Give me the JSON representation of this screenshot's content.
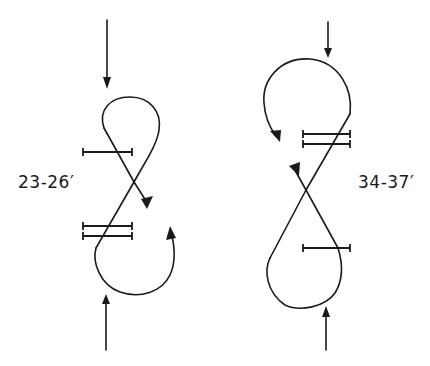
{
  "diagram": {
    "type": "figure-eight-track-diagram",
    "style": "hand-drawn line art, black on white",
    "colors": {
      "line": "#1a1a1a",
      "background": "#ffffff"
    },
    "figures": [
      {
        "id": "left",
        "label": "23-26′",
        "entry_arrow": "top, pointing down",
        "exit_arrow": "bottom, pointing up",
        "loops": [
          "small loop on top",
          "larger open loop at bottom with curving arrow"
        ],
        "bars": {
          "single": 1,
          "double": 2
        },
        "direction_arrowheads": 2
      },
      {
        "id": "right",
        "label": "34-37′",
        "entry_arrow": "top, pointing down",
        "exit_arrow": "bottom, pointing up",
        "loops": [
          "large loop on top with curving arrow",
          "teardrop loop at bottom"
        ],
        "bars": {
          "single": 1,
          "double": 2
        },
        "direction_arrowheads": 2
      }
    ]
  },
  "labels": {
    "left": "23-26′",
    "right": "34-37′"
  }
}
